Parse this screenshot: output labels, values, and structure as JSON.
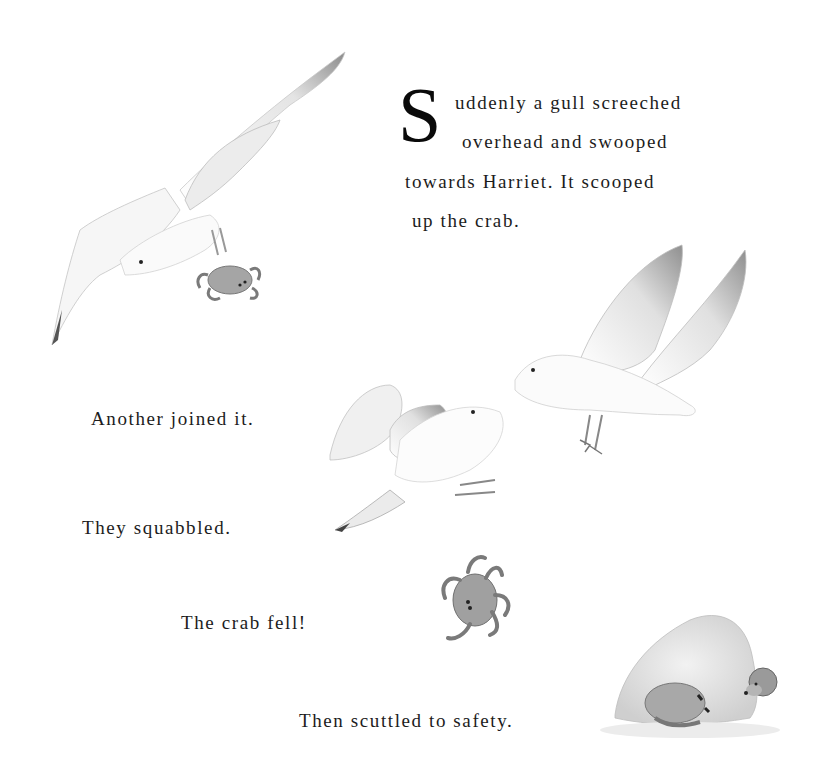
{
  "page": {
    "intro": {
      "drop_cap": "S",
      "lines": [
        "uddenly a gull screeched",
        "overhead and swooped",
        "towards Harriet. It scooped",
        "up the crab."
      ]
    },
    "captions": [
      "Another joined it.",
      "They squabbled.",
      "The crab fell!",
      "Then scuttled to safety."
    ]
  },
  "illustrations": [
    {
      "name": "gull-carrying-crab",
      "desc": "watercolor gull flying with crab in talons"
    },
    {
      "name": "two-gulls-squabbling",
      "desc": "two watercolor gulls fighting in flight"
    },
    {
      "name": "falling-crab",
      "desc": "watercolor crab falling"
    },
    {
      "name": "rock-with-crab-and-mouse",
      "desc": "crab hiding beside a rock with a small mouse peeking"
    }
  ],
  "colors": {
    "background": "#ffffff",
    "text": "#1c1c1c",
    "wash_grey": "#9a9a9a"
  }
}
